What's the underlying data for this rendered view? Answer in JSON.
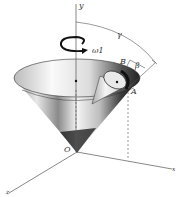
{
  "diagram": {
    "labels": {
      "y_axis": "y",
      "x_axis": "x",
      "z_axis": "z",
      "origin": "O",
      "point_a": "A",
      "point_b": "B",
      "angular_velocity": "ω",
      "angular_velocity_sub": "1",
      "gamma": "γ",
      "beta": "β"
    },
    "colors": {
      "line": "#444444",
      "cone_dark": "#1a1a1a",
      "cone_light": "#f2f2f2",
      "background": "#ffffff"
    }
  }
}
